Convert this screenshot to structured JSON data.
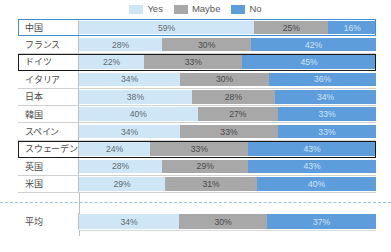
{
  "legend": {
    "items": [
      {
        "label": "Yes",
        "color": "#cfe6f6",
        "key": "yes"
      },
      {
        "label": "Maybe",
        "color": "#a8a8a8",
        "key": "maybe"
      },
      {
        "label": "No",
        "color": "#5d9ddb",
        "key": "no"
      }
    ]
  },
  "rows": [
    {
      "label": "中国",
      "yes": "59%",
      "maybe": "25%",
      "no": "16%",
      "highlight": "blue"
    },
    {
      "label": "フランス",
      "yes": "28%",
      "maybe": "30%",
      "no": "42%",
      "highlight": "none"
    },
    {
      "label": "ドイツ",
      "yes": "22%",
      "maybe": "33%",
      "no": "45%",
      "highlight": "black"
    },
    {
      "label": "イタリア",
      "yes": "34%",
      "maybe": "30%",
      "no": "36%",
      "highlight": "none"
    },
    {
      "label": "日本",
      "yes": "38%",
      "maybe": "28%",
      "no": "34%",
      "highlight": "none"
    },
    {
      "label": "韓国",
      "yes": "40%",
      "maybe": "27%",
      "no": "33%",
      "highlight": "none"
    },
    {
      "label": "スペイン",
      "yes": "34%",
      "maybe": "33%",
      "no": "33%",
      "highlight": "none"
    },
    {
      "label": "スウェーデン",
      "yes": "24%",
      "maybe": "33%",
      "no": "43%",
      "highlight": "black"
    },
    {
      "label": "英国",
      "yes": "28%",
      "maybe": "29%",
      "no": "43%",
      "highlight": "none"
    },
    {
      "label": "米国",
      "yes": "29%",
      "maybe": "31%",
      "no": "40%",
      "highlight": "none"
    }
  ],
  "average_row": {
    "label": "平均",
    "yes": "34%",
    "maybe": "30%",
    "no": "37%",
    "highlight": "none"
  },
  "chart_data": {
    "type": "bar",
    "orientation": "horizontal",
    "stacked": true,
    "normalized": true,
    "title": "",
    "subtitle": "",
    "xlabel": "",
    "ylabel": "",
    "xlim": [
      0,
      100
    ],
    "grid": false,
    "legend_position": "top-center",
    "categories": [
      "中国",
      "フランス",
      "ドイツ",
      "イタリア",
      "日本",
      "韓国",
      "スペイン",
      "スウェーデン",
      "英国",
      "米国",
      "平均"
    ],
    "series": [
      {
        "name": "Yes",
        "color": "#cfe6f6",
        "values": [
          59,
          28,
          22,
          34,
          38,
          40,
          34,
          24,
          28,
          29,
          34
        ]
      },
      {
        "name": "Maybe",
        "color": "#a8a8a8",
        "values": [
          25,
          30,
          33,
          30,
          28,
          27,
          33,
          33,
          29,
          31,
          30
        ]
      },
      {
        "name": "No",
        "color": "#5d9ddb",
        "values": [
          16,
          42,
          45,
          36,
          34,
          33,
          33,
          43,
          43,
          40,
          37
        ]
      }
    ],
    "data_labels": true,
    "annotations": [
      {
        "type": "highlight-box",
        "target": "中国",
        "color": "#3f8fd8"
      },
      {
        "type": "highlight-box",
        "target": "ドイツ",
        "color": "#1a1a1a"
      },
      {
        "type": "highlight-box",
        "target": "スウェーデン",
        "color": "#1a1a1a"
      },
      {
        "type": "dashed-separator",
        "position": "before-平均",
        "color": "#9cc4e4"
      }
    ]
  }
}
